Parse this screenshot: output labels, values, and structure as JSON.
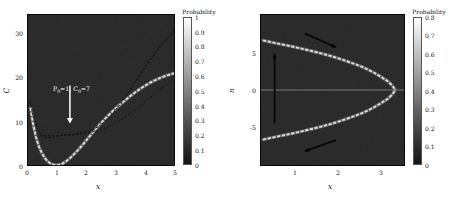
{
  "figure": {
    "background": "#ffffff",
    "panel_background": "#2b2b2b",
    "curve_bright": "#d8d8d8",
    "curve_dark": "#0b0b0b",
    "arrow_black": "#000000",
    "arrow_white": "#ffffff"
  },
  "chart_data": [
    {
      "type": "heatmap",
      "panel": "left",
      "title": "",
      "xlabel": "x",
      "ylabel": "C",
      "xlim": [
        0,
        5
      ],
      "ylim": [
        0,
        34
      ],
      "xticks": [
        "0",
        "1",
        "2",
        "3",
        "4",
        "5"
      ],
      "xtick_values": [
        0,
        1,
        2,
        3,
        4,
        5
      ],
      "yticks": [
        "0",
        "10",
        "20",
        "30"
      ],
      "ytick_values": [
        0,
        10,
        20,
        30
      ],
      "grid": false,
      "background_probability": 0.15,
      "colorbar": {
        "title": "Probability",
        "min": 0,
        "max": 1,
        "ticks": [
          "1",
          "0.9",
          "0.8",
          "0.7",
          "0.6",
          "0.5",
          "0.4",
          "0.3",
          "0.2",
          "0.1",
          "0"
        ],
        "tick_values": [
          1,
          0.9,
          0.8,
          0.7,
          0.6,
          0.5,
          0.4,
          0.3,
          0.2,
          0.1,
          0
        ],
        "colormap": "grayscale"
      },
      "annotation": {
        "text_prefix": "P",
        "text_sub1": "0",
        "text_mid": "=1, C",
        "text_sub2": "0",
        "text_suffix": "=7",
        "x": 1.45,
        "y": 20.5,
        "arrow_from_y": 18.0,
        "arrow_to_y": 9.5,
        "arrow_direction": "down",
        "arrow_color": "#ffffff"
      },
      "series": [
        {
          "name": "bright-probability-ridge",
          "style": "bright-dashed",
          "color": "#dcdcdc",
          "x": [
            0.12,
            0.2,
            0.3,
            0.4,
            0.5,
            0.6,
            0.7,
            0.8,
            0.9,
            1.0,
            1.1,
            1.2,
            1.3,
            1.4,
            1.5,
            1.7,
            1.9,
            2.1,
            2.3,
            2.5,
            2.7,
            2.9,
            3.1,
            3.3,
            3.5,
            3.7,
            3.9,
            4.1,
            4.3,
            4.5,
            4.7,
            4.9,
            5.0
          ],
          "values": [
            13.0,
            9.6,
            6.5,
            4.4,
            2.9,
            1.8,
            1.0,
            0.55,
            0.3,
            0.22,
            0.3,
            0.55,
            0.95,
            1.45,
            2.05,
            3.4,
            4.9,
            6.5,
            8.1,
            9.6,
            11.0,
            12.3,
            13.5,
            14.6,
            15.7,
            16.7,
            17.6,
            18.4,
            19.1,
            19.7,
            20.2,
            20.6,
            20.8
          ]
        },
        {
          "name": "dashed-upper-branch",
          "style": "dark-dashed",
          "color": "#0a0a0a",
          "x": [
            0.1,
            0.2,
            0.35,
            0.5,
            0.7,
            0.9,
            1.1,
            1.3,
            1.6,
            1.9,
            2.2,
            2.5,
            2.8,
            3.1,
            3.4,
            3.7,
            4.0,
            4.3,
            4.6,
            4.9,
            5.0
          ],
          "values": [
            14.5,
            11.5,
            8.4,
            6.8,
            6.3,
            6.5,
            6.8,
            7.0,
            7.2,
            7.5,
            8.0,
            9.2,
            11.0,
            13.4,
            16.2,
            19.2,
            22.2,
            25.1,
            27.6,
            29.7,
            30.3
          ]
        },
        {
          "name": "dashed-plateau-branch",
          "style": "dark-dashed",
          "color": "#151515",
          "x": [
            0.45,
            0.8,
            1.2,
            1.6,
            2.0,
            2.4,
            2.8,
            3.2,
            3.6,
            4.0,
            4.4,
            4.8,
            5.0
          ],
          "values": [
            6.9,
            6.75,
            6.8,
            6.95,
            7.3,
            7.9,
            8.9,
            10.4,
            12.3,
            14.4,
            16.6,
            18.8,
            19.9
          ]
        }
      ]
    },
    {
      "type": "heatmap",
      "panel": "right",
      "title": "",
      "xlabel": "x",
      "ylabel": "n",
      "xlim": [
        0.18,
        3.55
      ],
      "ylim": [
        -8.2,
        8.2
      ],
      "xticks": [
        "1",
        "2",
        "3"
      ],
      "xtick_values": [
        1,
        2,
        3
      ],
      "yticks": [
        "5",
        "0",
        "-5"
      ],
      "ytick_values": [
        5,
        0,
        -5
      ],
      "grid": false,
      "background_probability": 0.15,
      "colorbar": {
        "title": "Probability",
        "min": 0,
        "max": 0.85,
        "ticks": [
          "0.8",
          "0.7",
          "0.6",
          "0.5",
          "0.4",
          "0.3",
          "0.2",
          "0.1",
          "0"
        ],
        "tick_values": [
          0.8,
          0.7,
          0.6,
          0.5,
          0.4,
          0.3,
          0.2,
          0.1,
          0
        ],
        "colormap": "grayscale"
      },
      "series": [
        {
          "name": "upper-branch",
          "style": "bright-dashed",
          "color": "#dcdcdc",
          "x": [
            0.25,
            0.4,
            0.6,
            0.8,
            1.0,
            1.2,
            1.4,
            1.6,
            1.8,
            2.0,
            2.2,
            2.4,
            2.6,
            2.8,
            3.0,
            3.15,
            3.25,
            3.32
          ],
          "values": [
            5.35,
            5.2,
            5.0,
            4.82,
            4.62,
            4.4,
            4.18,
            3.95,
            3.7,
            3.42,
            3.1,
            2.78,
            2.4,
            1.95,
            1.4,
            0.95,
            0.5,
            0.05
          ]
        },
        {
          "name": "lower-branch",
          "style": "bright-dashed",
          "color": "#dcdcdc",
          "x": [
            0.25,
            0.4,
            0.6,
            0.8,
            1.0,
            1.2,
            1.4,
            1.6,
            1.8,
            2.0,
            2.2,
            2.4,
            2.6,
            2.8,
            3.0,
            3.15,
            3.25,
            3.32
          ],
          "values": [
            -5.35,
            -5.2,
            -5.0,
            -4.82,
            -4.62,
            -4.4,
            -4.18,
            -3.95,
            -3.7,
            -3.42,
            -3.1,
            -2.78,
            -2.4,
            -1.95,
            -1.4,
            -0.95,
            -0.5,
            -0.05
          ]
        },
        {
          "name": "horizontal-axis-line",
          "style": "thin-bright",
          "color": "#9a9a9a",
          "x": [
            0.18,
            3.55
          ],
          "values": [
            0,
            0
          ]
        }
      ],
      "arrows": [
        {
          "name": "upper-flow-arrow",
          "x1": 1.22,
          "y1": 6.1,
          "x2": 1.95,
          "y2": 4.6,
          "color": "#000000"
        },
        {
          "name": "lower-flow-arrow",
          "x1": 1.95,
          "y1": -5.4,
          "x2": 1.22,
          "y2": -6.6,
          "color": "#000000"
        },
        {
          "name": "vertical-flow-arrow",
          "x1": 0.52,
          "y1": -3.6,
          "x2": 0.52,
          "y2": 3.9,
          "color": "#000000"
        }
      ]
    }
  ]
}
